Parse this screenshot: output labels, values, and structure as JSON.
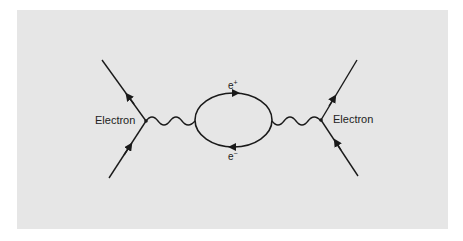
{
  "diagram": {
    "type": "feynman-diagram",
    "labels": {
      "left_particle": "Electron",
      "right_particle": "Electron",
      "loop_top": "e",
      "loop_top_sup": "+",
      "loop_bottom": "e",
      "loop_bottom_sup": "−"
    },
    "colors": {
      "background": "#e6e6e6",
      "line": "#1a1a1a"
    }
  }
}
